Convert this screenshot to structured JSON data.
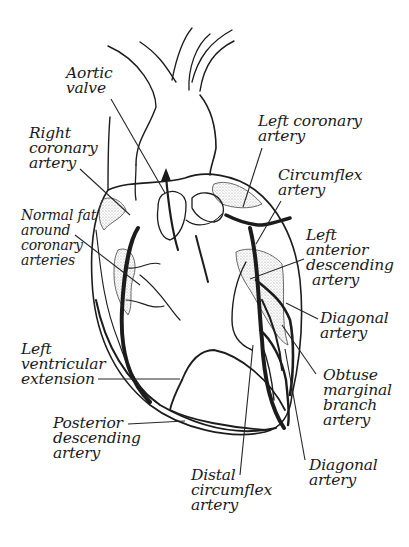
{
  "diagram": {
    "style": "black-and-white stippled line illustration",
    "colors": {
      "background": "#ffffff",
      "ink": "#1c1c1c",
      "stipple": "#9a9a9a"
    },
    "labels": [
      {
        "id": "aortic-valve",
        "lines": [
          "Aortic",
          "valve"
        ],
        "x": 66,
        "y": 73,
        "leader": [
          [
            111,
            99
          ],
          [
            165,
            193
          ]
        ]
      },
      {
        "id": "right-coronary-artery",
        "lines": [
          "Right",
          "coronary",
          "artery"
        ],
        "x": 29,
        "y": 124,
        "leader": [
          [
            80,
            169
          ],
          [
            130,
            215
          ]
        ]
      },
      {
        "id": "normal-fat",
        "lines": [
          "Normal fat",
          "around",
          "coronary",
          "arteries"
        ],
        "x": 21,
        "y": 210,
        "leader": [
          [
            75,
            235
          ],
          [
            140,
            285
          ]
        ]
      },
      {
        "id": "left-coronary-artery",
        "lines": [
          "Left coronary",
          "artery"
        ],
        "x": 259,
        "y": 112,
        "leader": [
          [
            262,
            148
          ],
          [
            243,
            207
          ]
        ]
      },
      {
        "id": "circumflex-artery",
        "lines": [
          "Circumflex",
          "artery"
        ],
        "x": 278,
        "y": 168,
        "leader": [
          [
            281,
            201
          ],
          [
            256,
            244
          ]
        ]
      },
      {
        "id": "left-anterior-descending-artery",
        "lines": [
          "Left",
          "anterior",
          "descending",
          "artery"
        ],
        "x": 307,
        "y": 228,
        "leader": [
          [
            304,
            259
          ],
          [
            250,
            279
          ]
        ]
      },
      {
        "id": "diagonal-artery-1",
        "lines": [
          "Diagonal",
          "artery"
        ],
        "x": 320,
        "y": 311,
        "leader": [
          [
            318,
            319
          ],
          [
            286,
            303
          ]
        ]
      },
      {
        "id": "left-ventricular-extension",
        "lines": [
          "Left",
          "ventricular",
          "extension"
        ],
        "x": 21,
        "y": 345,
        "leader": [
          [
            98,
            379
          ],
          [
            180,
            379
          ]
        ]
      },
      {
        "id": "obtuse-marginal-branch-artery",
        "lines": [
          "Obtuse",
          "marginal",
          "branch",
          "artery"
        ],
        "x": 323,
        "y": 368,
        "leader": [
          [
            316,
            374
          ],
          [
            282,
            325
          ]
        ]
      },
      {
        "id": "posterior-descending-artery",
        "lines": [
          "Posterior",
          "descending",
          "artery"
        ],
        "x": 53,
        "y": 418,
        "leader": [
          [
            128,
            424
          ],
          [
            185,
            421
          ]
        ]
      },
      {
        "id": "diagonal-artery-2",
        "lines": [
          "Diagonal",
          "artery"
        ],
        "x": 309,
        "y": 458,
        "leader": [
          [
            305,
            460
          ],
          [
            285,
            349
          ]
        ]
      },
      {
        "id": "distal-circumflex-artery",
        "lines": [
          "Distal",
          "circumflex",
          "artery"
        ],
        "x": 191,
        "y": 470,
        "leader": [
          [
            240,
            475
          ],
          [
            253,
            345
          ]
        ]
      }
    ]
  }
}
